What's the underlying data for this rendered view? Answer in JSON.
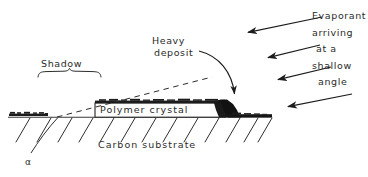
{
  "figure": {
    "type": "schematic-diagram",
    "ink_color": "#1c1c1c",
    "background_color": "#ffffff"
  },
  "labels": {
    "shadow": "Shadow",
    "heavy_deposit_line1": "Heavy",
    "heavy_deposit_line2": "deposit",
    "polymer_crystal": "Polymer  crystal",
    "carbon_substrate": "Carbon substrate",
    "angle_symbol": "α"
  },
  "evaporant_caption": {
    "line1": "Evaporant",
    "line2": "arriving",
    "line3": "at a",
    "line4": "shallow",
    "line5": "angle"
  },
  "annotations": {
    "arrows": [
      {
        "name": "evaporant-arrow-1",
        "from": [
          322,
          17
        ],
        "to": [
          244,
          33
        ]
      },
      {
        "name": "evaporant-arrow-2",
        "from": [
          320,
          45
        ],
        "to": [
          264,
          58
        ]
      },
      {
        "name": "evaporant-arrow-3",
        "from": [
          331,
          67
        ],
        "to": [
          274,
          80
        ]
      },
      {
        "name": "evaporant-arrow-4",
        "from": [
          352,
          94
        ],
        "to": [
          284,
          107
        ]
      },
      {
        "name": "heavy-deposit-curved-arrow",
        "from": [
          200,
          52
        ],
        "to": [
          235,
          101
        ]
      }
    ],
    "shadow_brace": {
      "from_x": 38,
      "to_x": 101,
      "y": 72
    },
    "shadow_ray_dashed": {
      "from": [
        57,
        117
      ],
      "to": [
        212,
        77
      ]
    },
    "alpha_leader": {
      "from": [
        31,
        153
      ],
      "to": [
        57,
        118
      ]
    }
  },
  "geometry": {
    "substrate_line": {
      "x1": 8,
      "x2": 272,
      "y": 117
    },
    "crystal_box": {
      "x": 95,
      "y": 103,
      "width": 130,
      "height": 14
    },
    "deposit_on_crystal": {
      "x": 95,
      "y": 99,
      "width": 130,
      "height": 4
    },
    "heavy_deposit_blob": {
      "x": 218,
      "y": 99,
      "width": 24,
      "height": 19
    },
    "thin_deposit_left": {
      "x": 8,
      "y": 113,
      "width": 40,
      "height": 4
    },
    "hatch_count": 13
  }
}
